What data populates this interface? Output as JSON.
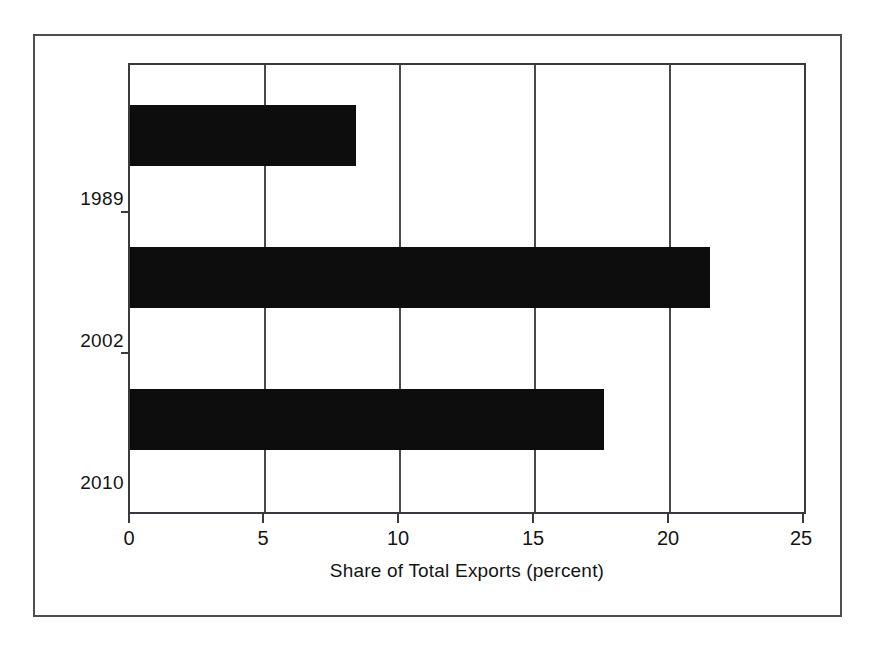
{
  "figure": {
    "kind": "horizontal-bar-chart",
    "background_color": "#ffffff",
    "frame_color": "#4e4e52",
    "bar_color": "#0d0d0d",
    "gridline_color": "#4a4a4e"
  },
  "chart_data": {
    "type": "bar",
    "orientation": "horizontal",
    "title": "",
    "subtitle": "",
    "categories": [
      "1989",
      "2002",
      "2010"
    ],
    "values": [
      8.4,
      21.5,
      17.6
    ],
    "series": [
      {
        "name": "Share of Total Exports",
        "values": [
          8.4,
          21.5,
          17.6
        ]
      }
    ],
    "xlabel": "Share of Total Exports (percent)",
    "ylabel": "",
    "xlim": [
      0,
      25
    ],
    "xticks": [
      0,
      5,
      10,
      15,
      20,
      25
    ],
    "xtick_labels": [
      "0",
      "5",
      "10",
      "15",
      "20",
      "25"
    ],
    "ytick_labels": [
      "1989",
      "2002",
      "2010"
    ],
    "grid": "vertical",
    "legend": "none",
    "annotations": []
  }
}
